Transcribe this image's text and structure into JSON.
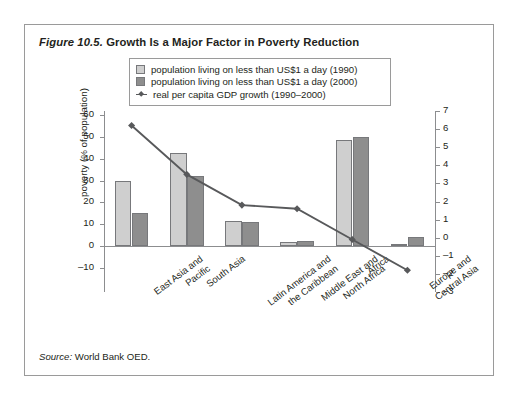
{
  "figure": {
    "label": "Figure 10.5.",
    "title": "Growth Is a Major Factor in Poverty Reduction",
    "source_prefix": "Source:",
    "source_text": "World Bank OED."
  },
  "legend": {
    "items": [
      {
        "marker": "light-square",
        "label": "population living on less than US$1 a day (1990)",
        "color": "#cfcfcf"
      },
      {
        "marker": "dark-square",
        "label": "population living on less than US$1 a day (2000)",
        "color": "#8e8e8e"
      },
      {
        "marker": "line-diamond",
        "label": "real per capita GDP growth (1990–2000)",
        "color": "#58595b"
      }
    ]
  },
  "chart_data": {
    "type": "bar",
    "title": "Growth Is a Major Factor in Poverty Reduction",
    "xlabel": "",
    "ylabel": "poverty (% of population)",
    "y2label": "growth (% per annum)",
    "ylim": [
      -10,
      60
    ],
    "y2lim": [
      -3,
      7
    ],
    "yticks": [
      60,
      50,
      40,
      30,
      20,
      10,
      0,
      -10
    ],
    "ytick_labels": [
      "60",
      "50",
      "40",
      "30",
      "20",
      "10",
      "0",
      "–10"
    ],
    "y2ticks": [
      7,
      6,
      5,
      4,
      3,
      2,
      1,
      0,
      -1,
      -2,
      -3
    ],
    "y2tick_labels": [
      "7",
      "6",
      "5",
      "4",
      "3",
      "2",
      "1",
      "0",
      "–1",
      "–2",
      "–3"
    ],
    "grid": false,
    "legend_position": "top-center",
    "categories": [
      "East Asia and Pacific",
      "South Asia",
      "Latin America and the Caribbean",
      "Middle East and North Africa",
      "Africa",
      "Europe and Central Asia"
    ],
    "category_lines": [
      [
        "East Asia and",
        "Pacific"
      ],
      [
        "South Asia"
      ],
      [
        "Latin America and",
        "the Caribbean"
      ],
      [
        "Middle East and",
        "North Africa"
      ],
      [
        "Africa"
      ],
      [
        "Europe and",
        "Central Asia"
      ]
    ],
    "series": [
      {
        "name": "population living on less than US$1 a day (1990)",
        "kind": "bar",
        "axis": "left",
        "color": "#cfcfcf",
        "values": [
          30,
          42.5,
          11.3,
          2.0,
          48.5,
          1.0
        ]
      },
      {
        "name": "population living on less than US$1 a day (2000)",
        "kind": "bar",
        "axis": "left",
        "color": "#8e8e8e",
        "values": [
          15,
          32,
          11,
          2.3,
          50,
          4.0
        ]
      },
      {
        "name": "real per capita GDP growth (1990–2000)",
        "kind": "line",
        "axis": "right",
        "color": "#58595b",
        "values": [
          6.2,
          3.5,
          1.8,
          1.6,
          -0.1,
          -1.8
        ]
      }
    ]
  }
}
